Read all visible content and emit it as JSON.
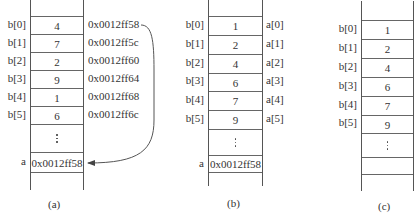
{
  "panels": [
    {
      "id": "a",
      "caption": "(a)",
      "labels": [
        "b[0]",
        "b[1]",
        "b[2]",
        "b[3]",
        "b[4]",
        "b[5]"
      ],
      "values": [
        "4",
        "7",
        "2",
        "9",
        "1",
        "6"
      ],
      "addresses": [
        "0x0012ff58",
        "0x0012ff5c",
        "0x0012ff60",
        "0x0012ff64",
        "0x0012ff68",
        "0x0012ff6c"
      ],
      "ellipsis": "⋮",
      "pointer_label": "a",
      "pointer_value": "0x0012ff58",
      "arrow": "from address 0x0012ff58 to pointer cell a"
    },
    {
      "id": "b",
      "caption": "(b)",
      "labels": [
        "b[0]",
        "b[1]",
        "b[2]",
        "b[3]",
        "b[4]",
        "b[5]"
      ],
      "values": [
        "1",
        "2",
        "4",
        "6",
        "7",
        "9"
      ],
      "aliases": [
        "a[0]",
        "a[1]",
        "a[2]",
        "a[3]",
        "a[4]",
        "a[5]"
      ],
      "ellipsis": "⋮",
      "pointer_label": "a",
      "pointer_value": "0x0012ff58"
    },
    {
      "id": "c",
      "caption": "(c)",
      "labels": [
        "b[0]",
        "b[1]",
        "b[2]",
        "b[3]",
        "b[4]",
        "b[5]"
      ],
      "values": [
        "1",
        "2",
        "4",
        "6",
        "7",
        "9"
      ],
      "ellipsis": "⋮"
    }
  ]
}
